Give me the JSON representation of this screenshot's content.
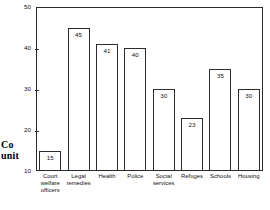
{
  "chart_data": {
    "type": "bar",
    "title": "",
    "subtitle": "",
    "xlabel": "",
    "ylabel": "Co unit",
    "ylabel_lines": [
      "Co",
      "unit"
    ],
    "categories": [
      "Court welfare officers",
      "Legal remedies",
      "Health",
      "Police",
      "Social services",
      "Refuges",
      "Schools",
      "Housing"
    ],
    "category_lines": [
      [
        "Court",
        "welfare",
        "officers"
      ],
      [
        "Legal",
        "remedies"
      ],
      [
        "Health"
      ],
      [
        "Police"
      ],
      [
        "Social",
        "services"
      ],
      [
        "Refuges"
      ],
      [
        "Schools"
      ],
      [
        "Housing"
      ]
    ],
    "values": [
      15,
      45,
      41,
      40,
      30,
      23,
      35,
      30
    ],
    "value_labels": [
      "15",
      "45",
      "41",
      "40",
      "30",
      "23",
      "35",
      "30"
    ],
    "ylim": [
      10,
      50
    ],
    "yticks": [
      10,
      20,
      30,
      40,
      50
    ],
    "ytick_labels": [
      "10",
      "20",
      "30",
      "40",
      "50"
    ],
    "grid": false,
    "legend": false,
    "legend_position": "none",
    "bar_fill_color": "#ffffff",
    "bar_edge_color": "#2b2b2b",
    "axis_color": "#2b2b2b",
    "background_color": "#ffffff"
  }
}
